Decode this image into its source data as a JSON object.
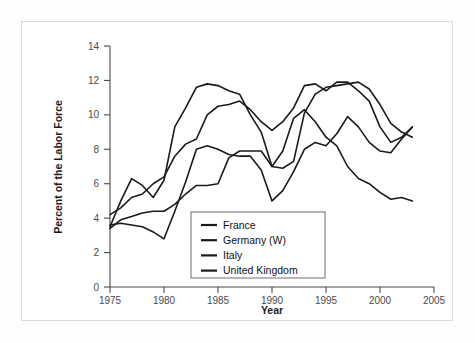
{
  "chart_data": {
    "type": "line",
    "title": "",
    "xlabel": "Year",
    "ylabel": "Percent of the Labor Force",
    "xlim": [
      1975,
      2005
    ],
    "ylim": [
      0,
      14
    ],
    "xticks": [
      "1975",
      "1980",
      "1985",
      "1990",
      "1995",
      "2000",
      "2005"
    ],
    "yticks": [
      "0",
      "2",
      "4",
      "6",
      "8",
      "10",
      "12",
      "14"
    ],
    "grid": false,
    "legend_position": "lower-center-right",
    "line_color": "#1a1a1a",
    "x": [
      1975,
      1976,
      1977,
      1978,
      1979,
      1980,
      1981,
      1982,
      1983,
      1984,
      1985,
      1986,
      1987,
      1988,
      1989,
      1990,
      1991,
      1992,
      1993,
      1994,
      1995,
      1996,
      1997,
      1998,
      1999,
      2000,
      2001,
      2002,
      2003
    ],
    "series": [
      {
        "name": "France",
        "values": [
          4.2,
          4.6,
          5.2,
          5.4,
          6.0,
          6.4,
          7.6,
          8.3,
          8.6,
          10.0,
          10.5,
          10.6,
          10.8,
          10.3,
          9.6,
          9.1,
          9.6,
          10.4,
          11.7,
          11.8,
          11.4,
          11.9,
          11.9,
          11.4,
          10.8,
          9.3,
          8.4,
          8.7,
          9.3
        ]
      },
      {
        "name": "Germany (W)",
        "values": [
          3.6,
          3.7,
          3.6,
          3.5,
          3.2,
          2.8,
          4.4,
          6.1,
          8.0,
          8.2,
          8.0,
          7.7,
          7.6,
          7.6,
          6.8,
          5.0,
          5.6,
          6.7,
          8.0,
          8.4,
          8.2,
          8.9,
          9.9,
          9.3,
          8.4,
          7.9,
          7.8,
          8.6,
          9.3
        ]
      },
      {
        "name": "Italy",
        "values": [
          3.4,
          3.9,
          4.1,
          4.3,
          4.4,
          4.4,
          4.8,
          5.4,
          5.9,
          5.9,
          6.0,
          7.5,
          7.9,
          7.9,
          7.9,
          7.0,
          6.9,
          7.3,
          10.1,
          11.2,
          11.6,
          11.7,
          11.8,
          11.9,
          11.5,
          10.6,
          9.5,
          9.0,
          8.7
        ]
      },
      {
        "name": "United Kingdom",
        "values": [
          3.5,
          5.0,
          6.3,
          5.9,
          5.2,
          6.2,
          9.3,
          10.4,
          11.6,
          11.8,
          11.7,
          11.4,
          11.2,
          10.0,
          9.0,
          7.0,
          7.9,
          9.8,
          10.3,
          9.6,
          8.7,
          8.2,
          7.0,
          6.3,
          6.0,
          5.5,
          5.1,
          5.2,
          5.0
        ]
      }
    ]
  },
  "axes": {
    "y_title": "Percent of the Labor Force",
    "x_title": "Year"
  },
  "legend": {
    "entries": [
      {
        "label": "France"
      },
      {
        "label": "Germany (W)"
      },
      {
        "label": "Italy"
      },
      {
        "label": "United Kingdom"
      }
    ]
  }
}
